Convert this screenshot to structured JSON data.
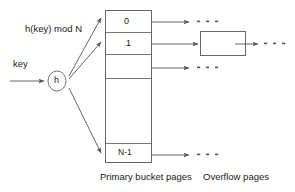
{
  "diagram": {
    "hash_expression": "h(key) mod N",
    "key_label": "key",
    "hash_function_label": "h",
    "buckets": [
      {
        "label": "0"
      },
      {
        "label": "1"
      },
      {
        "label": ""
      },
      {
        "label": ""
      },
      {
        "label": "N-1"
      }
    ],
    "captions": {
      "primary": "Primary bucket pages",
      "overflow": "Overflow pages"
    },
    "colors": {
      "stroke": "#555555",
      "box_stroke": "#666666",
      "text": "#1a1a1a",
      "background": "#ffffff"
    }
  }
}
